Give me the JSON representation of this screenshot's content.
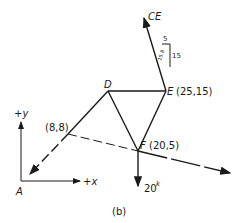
{
  "figure": {
    "caption": "(b)",
    "axes": {
      "y_label": "+y",
      "x_label": "+x",
      "origin_label": "A"
    },
    "points": {
      "D": {
        "label": "D"
      },
      "E": {
        "label": "E",
        "coords": "(25,15)"
      },
      "F": {
        "label": "F",
        "coords": "(20,5)"
      },
      "P": {
        "coords": "(8,8)"
      }
    },
    "forces": {
      "CE": {
        "label": "CE"
      },
      "load": {
        "value": "20",
        "unit": "k"
      }
    },
    "slope_triangle": {
      "rise": "15",
      "run": "5",
      "hyp": "15.8"
    }
  }
}
